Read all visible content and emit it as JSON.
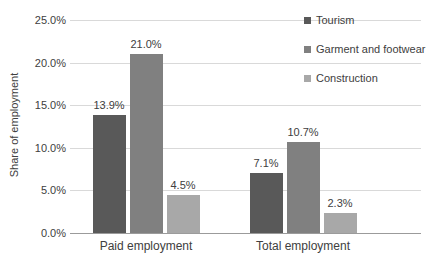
{
  "chart_data": {
    "type": "bar",
    "title": "",
    "ylabel": "Share of employment",
    "xlabel": "",
    "categories": [
      "Paid employment",
      "Total employment"
    ],
    "series": [
      {
        "name": "Tourism",
        "color": "#595959",
        "values": [
          13.9,
          7.1
        ],
        "labels": [
          "13.9%",
          "7.1%"
        ]
      },
      {
        "name": "Garment and footwear",
        "color": "#808080",
        "values": [
          21.0,
          10.7
        ],
        "labels": [
          "21.0%",
          "10.7%"
        ]
      },
      {
        "name": "Construction",
        "color": "#a8a8a8",
        "values": [
          4.5,
          2.3
        ],
        "labels": [
          "4.5%",
          "2.3%"
        ]
      }
    ],
    "ylim": [
      0,
      25
    ],
    "ytick_step": 5,
    "yticks": [
      "0.0%",
      "5.0%",
      "10.0%",
      "15.0%",
      "20.0%",
      "25.0%"
    ],
    "grid": true,
    "legend_position": "top-right",
    "colors": {
      "gridline": "#d9d9d9",
      "axis_line": "#9b9b9b",
      "text": "#404040",
      "background": "#ffffff"
    }
  }
}
